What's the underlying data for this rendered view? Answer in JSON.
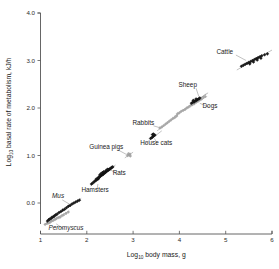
{
  "chart_data": {
    "type": "scatter",
    "title": "",
    "xlabel": "Log10 body mass, g",
    "ylabel": "Log10 basal rate of metabolism, kJ/h",
    "xlabel_base": "Log",
    "xlabel_sub": "10",
    "xlabel_rest": " body mass, g",
    "ylabel_base": "Log",
    "ylabel_sub": "10",
    "ylabel_rest": " basal rate of metabolism, kJ/h",
    "xlim": [
      1,
      6
    ],
    "ylim": [
      -0.5,
      4.0
    ],
    "xticks": [
      "1",
      "2",
      "3",
      "4",
      "5",
      "6"
    ],
    "xtick_values": [
      1,
      2,
      3,
      4,
      5,
      6
    ],
    "yticks": [
      "0.0",
      "1.0",
      "2.0",
      "3.0",
      "4.0"
    ],
    "ytick_values": [
      0.0,
      1.0,
      2.0,
      3.0,
      4.0
    ],
    "grid": false,
    "legend": "none",
    "marker_dark_color": "#1c1c1c",
    "marker_light_color": "#a8a8a8",
    "line_color": "#8e8e8e",
    "axis_color": "#555555",
    "groups": [
      {
        "name": "Peromyscus",
        "label": "Peromyscus",
        "italic": true,
        "marker": "light",
        "fit": [
          [
            1.08,
            -0.46
          ],
          [
            1.62,
            -0.17
          ]
        ],
        "points": [
          [
            1.1,
            -0.45
          ],
          [
            1.14,
            -0.43
          ],
          [
            1.18,
            -0.42
          ],
          [
            1.21,
            -0.4
          ],
          [
            1.24,
            -0.38
          ],
          [
            1.27,
            -0.37
          ],
          [
            1.31,
            -0.35
          ],
          [
            1.34,
            -0.33
          ],
          [
            1.38,
            -0.31
          ],
          [
            1.42,
            -0.3
          ],
          [
            1.46,
            -0.27
          ],
          [
            1.5,
            -0.25
          ],
          [
            1.55,
            -0.22
          ],
          [
            1.6,
            -0.19
          ]
        ],
        "label_pos": [
          1.55,
          -0.57
        ],
        "leader": [
          [
            1.5,
            -0.545
          ],
          [
            1.34,
            -0.44
          ]
        ]
      },
      {
        "name": "Mus",
        "label": "Mus",
        "italic": true,
        "marker": "dark",
        "fit": [
          [
            1.12,
            -0.42
          ],
          [
            1.88,
            0.1
          ]
        ],
        "points": [
          [
            1.15,
            -0.38
          ],
          [
            1.18,
            -0.35
          ],
          [
            1.2,
            -0.34
          ],
          [
            1.23,
            -0.32
          ],
          [
            1.25,
            -0.3
          ],
          [
            1.28,
            -0.29
          ],
          [
            1.3,
            -0.27
          ],
          [
            1.33,
            -0.25
          ],
          [
            1.36,
            -0.23
          ],
          [
            1.4,
            -0.2
          ],
          [
            1.44,
            -0.18
          ],
          [
            1.48,
            -0.15
          ],
          [
            1.52,
            -0.13
          ],
          [
            1.56,
            -0.1
          ],
          [
            1.6,
            -0.07
          ],
          [
            1.64,
            -0.05
          ],
          [
            1.68,
            -0.02
          ],
          [
            1.72,
            0.0
          ],
          [
            1.76,
            0.02
          ],
          [
            1.8,
            0.04
          ],
          [
            1.84,
            0.06
          ]
        ],
        "label_pos": [
          1.38,
          0.1
        ],
        "leader": [
          [
            1.47,
            0.065
          ],
          [
            1.62,
            -0.02
          ]
        ]
      },
      {
        "name": "Hamsters",
        "label": "Hamsters",
        "italic": false,
        "marker": "dark",
        "fit": [
          [
            2.08,
            0.36
          ],
          [
            2.3,
            0.54
          ]
        ],
        "points": [
          [
            2.1,
            0.4
          ],
          [
            2.13,
            0.42
          ],
          [
            2.16,
            0.45
          ],
          [
            2.19,
            0.47
          ],
          [
            2.22,
            0.49
          ],
          [
            2.25,
            0.51
          ]
        ],
        "label_pos": [
          2.18,
          0.24
        ],
        "leader": [
          [
            2.22,
            0.275
          ],
          [
            2.24,
            0.4
          ]
        ]
      },
      {
        "name": "Rats",
        "label": "Rats",
        "italic": false,
        "marker": "dark",
        "fit": [
          [
            2.14,
            0.44
          ],
          [
            2.62,
            0.8
          ]
        ],
        "points": [
          [
            2.2,
            0.5
          ],
          [
            2.23,
            0.52
          ],
          [
            2.25,
            0.53
          ],
          [
            2.27,
            0.55
          ],
          [
            2.29,
            0.56
          ],
          [
            2.31,
            0.58
          ],
          [
            2.33,
            0.59
          ],
          [
            2.35,
            0.6
          ],
          [
            2.36,
            0.62
          ],
          [
            2.38,
            0.63
          ],
          [
            2.4,
            0.64
          ],
          [
            2.41,
            0.66
          ],
          [
            2.43,
            0.67
          ],
          [
            2.44,
            0.68
          ],
          [
            2.46,
            0.69
          ],
          [
            2.47,
            0.7
          ],
          [
            2.49,
            0.71
          ],
          [
            2.5,
            0.72
          ],
          [
            2.52,
            0.73
          ],
          [
            2.54,
            0.75
          ],
          [
            2.56,
            0.76
          ],
          [
            2.34,
            0.64
          ],
          [
            2.37,
            0.66
          ],
          [
            2.42,
            0.69
          ],
          [
            2.45,
            0.71
          ],
          [
            2.28,
            0.59
          ],
          [
            2.31,
            0.62
          ]
        ],
        "label_pos": [
          2.7,
          0.59
        ],
        "leader": [
          [
            2.665,
            0.615
          ],
          [
            2.5,
            0.7
          ]
        ]
      },
      {
        "name": "Guinea pigs",
        "label": "Guinea pigs",
        "italic": false,
        "marker": "light",
        "fit": [
          [
            2.82,
            0.95
          ],
          [
            3.0,
            1.07
          ]
        ],
        "points": [
          [
            2.88,
            1.0
          ],
          [
            2.91,
            1.01
          ],
          [
            2.93,
            1.03
          ],
          [
            2.9,
            1.04
          ],
          [
            2.94,
            0.99
          ]
        ],
        "label_pos": [
          2.42,
          1.14
        ],
        "leader": [
          [
            2.68,
            1.115
          ],
          [
            2.86,
            1.02
          ]
        ]
      },
      {
        "name": "House cats",
        "label": "House cats",
        "italic": false,
        "marker": "dark",
        "fit": [
          [
            3.26,
            1.25
          ],
          [
            3.62,
            1.52
          ]
        ],
        "points": [
          [
            3.38,
            1.36
          ],
          [
            3.41,
            1.38
          ],
          [
            3.43,
            1.4
          ],
          [
            3.45,
            1.42
          ],
          [
            3.47,
            1.43
          ],
          [
            3.42,
            1.44
          ],
          [
            3.44,
            1.45
          ]
        ],
        "label_pos": [
          3.5,
          1.22
        ],
        "leader": [
          [
            3.52,
            1.255
          ],
          [
            3.46,
            1.36
          ]
        ]
      },
      {
        "name": "Rabbits",
        "label": "Rabbits",
        "italic": false,
        "marker": "light",
        "fit": [
          [
            3.52,
            1.52
          ],
          [
            3.98,
            1.86
          ]
        ],
        "points": [
          [
            3.58,
            1.58
          ],
          [
            3.62,
            1.6
          ],
          [
            3.66,
            1.63
          ],
          [
            3.7,
            1.66
          ],
          [
            3.74,
            1.69
          ],
          [
            3.78,
            1.72
          ],
          [
            3.82,
            1.75
          ],
          [
            3.86,
            1.78
          ],
          [
            3.9,
            1.8
          ],
          [
            3.94,
            1.83
          ]
        ],
        "label_pos": [
          3.22,
          1.65
        ],
        "leader": [
          [
            3.44,
            1.625
          ],
          [
            3.58,
            1.585
          ]
        ]
      },
      {
        "name": "Dogs",
        "label": "Dogs",
        "italic": false,
        "marker": "light",
        "fit": [
          [
            3.88,
            1.82
          ],
          [
            4.62,
            2.32
          ]
        ],
        "points": [
          [
            3.96,
            1.88
          ],
          [
            4.0,
            1.9
          ],
          [
            4.04,
            1.93
          ],
          [
            4.08,
            1.95
          ],
          [
            4.12,
            1.97
          ],
          [
            4.16,
            2.0
          ],
          [
            4.2,
            2.02
          ],
          [
            4.24,
            2.05
          ],
          [
            4.28,
            2.07
          ],
          [
            4.32,
            2.09
          ],
          [
            4.36,
            2.12
          ],
          [
            4.4,
            2.14
          ],
          [
            4.44,
            2.17
          ],
          [
            4.48,
            2.19
          ],
          [
            4.52,
            2.22
          ],
          [
            4.56,
            2.24
          ]
        ],
        "label_pos": [
          4.66,
          1.99
        ],
        "leader": [
          [
            4.63,
            2.02
          ],
          [
            4.44,
            2.1
          ]
        ]
      },
      {
        "name": "Sheep",
        "label": "Sheep",
        "italic": false,
        "marker": "dark",
        "fit": [
          [
            4.18,
            2.02
          ],
          [
            4.58,
            2.3
          ]
        ],
        "points": [
          [
            4.26,
            2.1
          ],
          [
            4.29,
            2.12
          ],
          [
            4.32,
            2.13
          ],
          [
            4.34,
            2.15
          ],
          [
            4.37,
            2.16
          ],
          [
            4.39,
            2.18
          ],
          [
            4.42,
            2.19
          ],
          [
            4.44,
            2.21
          ],
          [
            4.3,
            2.16
          ],
          [
            4.36,
            2.19
          ]
        ],
        "label_pos": [
          4.18,
          2.45
        ],
        "leader": [
          [
            4.36,
            2.415
          ],
          [
            4.42,
            2.24
          ]
        ]
      },
      {
        "name": "Cattle",
        "label": "Cattle",
        "italic": false,
        "marker": "dark",
        "fit": [
          [
            5.24,
            2.8
          ],
          [
            6.0,
            3.22
          ]
        ],
        "points": [
          [
            5.34,
            2.88
          ],
          [
            5.38,
            2.9
          ],
          [
            5.42,
            2.92
          ],
          [
            5.46,
            2.94
          ],
          [
            5.5,
            2.96
          ],
          [
            5.54,
            2.98
          ],
          [
            5.58,
            3.0
          ],
          [
            5.62,
            3.02
          ],
          [
            5.66,
            3.04
          ],
          [
            5.7,
            3.06
          ],
          [
            5.74,
            3.08
          ],
          [
            5.78,
            3.1
          ],
          [
            5.84,
            3.12
          ],
          [
            5.9,
            3.14
          ],
          [
            5.52,
            2.93
          ],
          [
            5.6,
            2.97
          ],
          [
            5.68,
            3.01
          ],
          [
            5.76,
            3.05
          ]
        ],
        "label_pos": [
          4.98,
          3.14
        ],
        "leader": [
          [
            5.22,
            3.115
          ],
          [
            5.44,
            3.0
          ]
        ]
      }
    ]
  },
  "figure": {
    "background": "#ffffff"
  }
}
